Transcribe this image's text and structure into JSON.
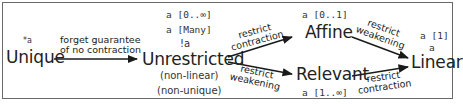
{
  "nodes": {
    "unique": {
      "label": "Unique",
      "annotation": "*a"
    },
    "unrestricted": {
      "label": "Unrestricted",
      "annotations": [
        "a [0..∞]",
        "a [Many]",
        "!a"
      ],
      "notes": [
        "(non-linear)",
        "(non-unique)"
      ]
    },
    "affine": {
      "label": "Affine",
      "annotation": "a [0..1]"
    },
    "relevant": {
      "label": "Relevant",
      "annotation": "a [1..∞]"
    },
    "linear": {
      "label": "Linear",
      "annotations": [
        "a [1]",
        "a"
      ]
    }
  },
  "edges": [
    {
      "from": "Unique",
      "to": "Unrestricted",
      "label_lines": [
        "forget guarantee",
        "of no contraction"
      ]
    },
    {
      "from": "Unrestricted",
      "to": "Affine",
      "label_lines": [
        "restrict",
        "contraction"
      ]
    },
    {
      "from": "Unrestricted",
      "to": "Relevant",
      "label_lines": [
        "restrict",
        "weakening"
      ]
    },
    {
      "from": "Affine",
      "to": "Linear",
      "label_lines": [
        "restrict",
        "weakening"
      ]
    },
    {
      "from": "Relevant",
      "to": "Linear",
      "label_lines": [
        "restrict",
        "contraction"
      ]
    }
  ],
  "colors": {
    "border": "#6a6a6a",
    "arrow": "#1a1a1a",
    "text": "#222222"
  }
}
